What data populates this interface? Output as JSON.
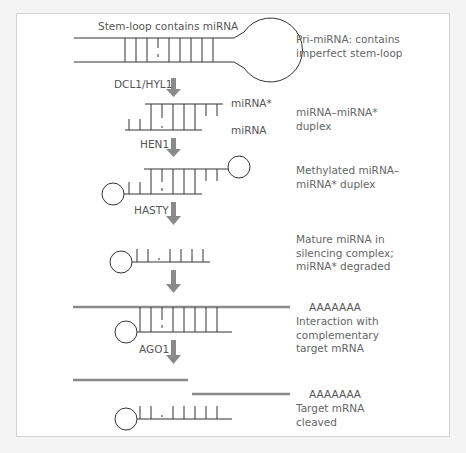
{
  "figure": {
    "title_label": "Stem-loop contains miRNA",
    "colors": {
      "stroke": "#333333",
      "mrna": "#8a8a8a",
      "arrow": "#8a8a8a",
      "text": "#555555",
      "background": "#f4f4f4",
      "panel": "#ffffff",
      "border": "#d4d4d4"
    }
  },
  "strand_labels": {
    "mirna_star": "miRNA*",
    "mirna": "miRNA",
    "polya_1": "AAAAAAA",
    "polya_2": "AAAAAAA"
  },
  "enzymes": [
    {
      "id": "dcl1",
      "label": "DCL1/HYL1"
    },
    {
      "id": "hen1",
      "label": "HEN1"
    },
    {
      "id": "hasty",
      "label": "HASTY"
    },
    {
      "id": "unlabeled",
      "label": ""
    },
    {
      "id": "ago1",
      "label": "AGO1"
    }
  ],
  "stages": [
    {
      "id": "pri-mirna",
      "description": "Pri-miRNA: contains\nimperfect stem-loop"
    },
    {
      "id": "duplex",
      "description": "miRNA–miRNA*\nduplex"
    },
    {
      "id": "methylated",
      "description": "Methylated miRNA–\nmiRNA* duplex"
    },
    {
      "id": "mature",
      "description": "Mature miRNA in\nsilencing complex;\nmiRNA* degraded"
    },
    {
      "id": "interaction",
      "description": "Interaction with\ncomplementary\ntarget mRNA"
    },
    {
      "id": "cleaved",
      "description": "Target mRNA\ncleaved"
    }
  ]
}
